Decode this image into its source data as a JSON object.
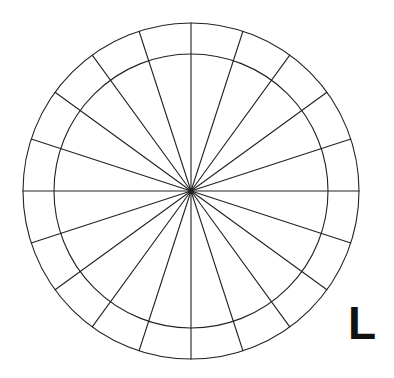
{
  "page": {
    "background_color": "#ffffff",
    "width": 394,
    "height": 378
  },
  "annotation": {
    "corner_label": "L",
    "color": "#111111",
    "position": {
      "x": 348,
      "y": 300
    },
    "font_size": 46,
    "font_weight": "bold"
  },
  "chart_data": {
    "type": "pie",
    "title": "",
    "subtitle": "",
    "xlabel": "",
    "ylabel": "",
    "legend": [],
    "annotations": [
      "L"
    ],
    "grid": true,
    "center": {
      "x": 191,
      "y": 191
    },
    "rings": [
      {
        "name": "inner-circle",
        "radius": 137
      },
      {
        "name": "outer-circle",
        "radius": 168
      }
    ],
    "spoke_count": 20,
    "sector_angle_degrees": 18,
    "categories": [
      "0",
      "18",
      "36",
      "54",
      "72",
      "90",
      "108",
      "126",
      "144",
      "162",
      "180",
      "198",
      "216",
      "234",
      "252",
      "270",
      "288",
      "306",
      "324",
      "342"
    ],
    "values": [
      18,
      18,
      18,
      18,
      18,
      18,
      18,
      18,
      18,
      18,
      18,
      18,
      18,
      18,
      18,
      18,
      18,
      18,
      18,
      18
    ],
    "spoke_angles_degrees": [
      0,
      18,
      36,
      54,
      72,
      90,
      108,
      126,
      144,
      162,
      180,
      198,
      216,
      234,
      252,
      270,
      288,
      306,
      324,
      342
    ],
    "stroke": {
      "color": "#222222",
      "width": 1.1,
      "center_dot_radius": 3
    },
    "fill": "none"
  }
}
